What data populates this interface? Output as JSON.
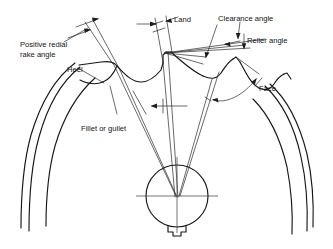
{
  "diagram": {
    "type": "engineering-line-drawing",
    "background_color": "#ffffff",
    "line_color": "#1d1d1f",
    "labels": {
      "positive_rake_line1": "Positive redial",
      "positive_rake_line2": "rake angle",
      "heel": "Heel",
      "fillet_or_gullet": "Fillet or gullet",
      "land": "Land",
      "clearance_angle": "Clearance angle",
      "relief_angle": "Relier angle",
      "face": "Face"
    },
    "features": [
      "Positive redial rake angle",
      "Heel",
      "Fillet or gullet",
      "Land",
      "Clearance angle",
      "Relier angle",
      "Face"
    ],
    "center_hub": {
      "description": "bore circle with keyway and crossed centerlines",
      "bore_label": "",
      "keyway": "bottom"
    }
  }
}
